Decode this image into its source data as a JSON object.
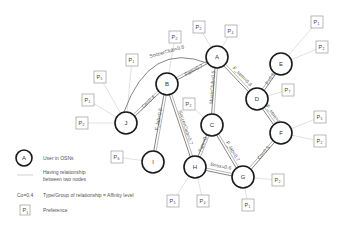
{
  "nodes": [
    {
      "id": "A",
      "label": "A",
      "x": 217,
      "y": 57
    },
    {
      "id": "B",
      "label": "B",
      "x": 167,
      "y": 84
    },
    {
      "id": "C",
      "label": "C",
      "x": 212,
      "y": 125
    },
    {
      "id": "D",
      "label": "D",
      "x": 257,
      "y": 99
    },
    {
      "id": "E",
      "label": "E",
      "x": 281,
      "y": 64
    },
    {
      "id": "F",
      "label": "F",
      "x": 281,
      "y": 133
    },
    {
      "id": "G",
      "label": "G",
      "x": 243,
      "y": 177
    },
    {
      "id": "H",
      "label": "H",
      "x": 195,
      "y": 167
    },
    {
      "id": "I",
      "label": "I",
      "x": 153,
      "y": 162
    },
    {
      "id": "J",
      "label": "J",
      "x": 126,
      "y": 123
    }
  ],
  "edges": [
    {
      "from": "J",
      "to": "A",
      "label": "SoccerClub=0.8",
      "curved": true
    },
    {
      "from": "B",
      "to": "A",
      "label": "Fam=0.7"
    },
    {
      "from": "J",
      "to": "B",
      "label": "Co=0.4"
    },
    {
      "from": "B",
      "to": "I",
      "label": "F_lab=0.6"
    },
    {
      "from": "B",
      "to": "H",
      "label": "SoccerClub=0.7"
    },
    {
      "from": "A",
      "to": "C",
      "label": "MusicClub=0.5"
    },
    {
      "from": "A",
      "to": "D",
      "label": "F_sem=0.8"
    },
    {
      "from": "D",
      "to": "E",
      "label": "F=0.6"
    },
    {
      "from": "D",
      "to": "F",
      "label": "F_sem=0.6"
    },
    {
      "from": "C",
      "to": "H",
      "label": "Fam=0.8"
    },
    {
      "from": "C",
      "to": "G",
      "label": "F_lab=0.7"
    },
    {
      "from": "H",
      "to": "G",
      "label": "Boss=0.6"
    },
    {
      "from": "G",
      "to": "F",
      "label": "Co=0.5"
    }
  ],
  "preferences": [
    {
      "node": "A",
      "p": "P",
      "sub": "2",
      "x": 199,
      "y": 27
    },
    {
      "node": "A",
      "p": "P",
      "sub": "4",
      "x": 231,
      "y": 31
    },
    {
      "node": "B",
      "p": "P",
      "sub": "2",
      "x": 175,
      "y": 37
    },
    {
      "node": "J",
      "p": "P",
      "sub": "1",
      "x": 132,
      "y": 60
    },
    {
      "node": "J",
      "p": "P",
      "sub": "5",
      "x": 100,
      "y": 77
    },
    {
      "node": "J",
      "p": "P",
      "sub": "1",
      "x": 88,
      "y": 100
    },
    {
      "node": "J",
      "p": "P",
      "sub": "2",
      "x": 82,
      "y": 123
    },
    {
      "node": "I",
      "p": "P",
      "sub": "6",
      "x": 117,
      "y": 157
    },
    {
      "node": "C",
      "p": "P",
      "sub": "2",
      "x": 189,
      "y": 104
    },
    {
      "node": "D",
      "p": "P",
      "sub": "7",
      "x": 288,
      "y": 90
    },
    {
      "node": "E",
      "p": "P",
      "sub": "1",
      "x": 317,
      "y": 22
    },
    {
      "node": "E",
      "p": "P",
      "sub": "2",
      "x": 322,
      "y": 47
    },
    {
      "node": "F",
      "p": "P",
      "sub": "5",
      "x": 320,
      "y": 117
    },
    {
      "node": "F",
      "p": "P",
      "sub": "2",
      "x": 320,
      "y": 141
    },
    {
      "node": "G",
      "p": "P",
      "sub": "2",
      "x": 278,
      "y": 180
    },
    {
      "node": "G",
      "p": "P",
      "sub": "1",
      "x": 248,
      "y": 205
    },
    {
      "node": "H",
      "p": "P",
      "sub": "5",
      "x": 173,
      "y": 201
    },
    {
      "node": "H",
      "p": "P",
      "sub": "4",
      "x": 203,
      "y": 201
    }
  ],
  "legend": {
    "node_sample": "A",
    "node_desc": "User in OSNs",
    "line_desc_1": "Having relationship",
    "line_desc_2": "between two nodes",
    "edge_sample": "Co=0.4",
    "edge_desc": "Type/Group of relationship = Affinity level",
    "pref_sample_p": "P",
    "pref_sample_sub": "1",
    "pref_desc": "Preference"
  }
}
